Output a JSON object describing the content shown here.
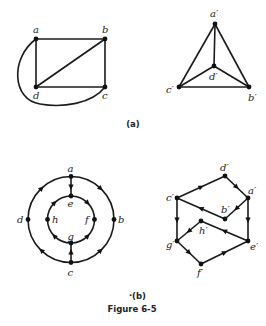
{
  "figure": {
    "caption": "Figure 6-5",
    "part_a_label": "(a)",
    "part_b_label": "(b)",
    "dot_mark": "·"
  },
  "graph_a_left": {
    "nodes": {
      "a": "a",
      "b": "b",
      "c": "c",
      "d": "d"
    },
    "edges": [
      [
        "a",
        "b"
      ],
      [
        "b",
        "c"
      ],
      [
        "c",
        "d"
      ],
      [
        "d",
        "a"
      ],
      [
        "d",
        "b"
      ],
      [
        "a",
        "c"
      ]
    ]
  },
  "graph_a_right": {
    "nodes": {
      "a": "a′",
      "b": "b′",
      "c": "c′",
      "d": "d′"
    },
    "edges": [
      [
        "a′",
        "b′"
      ],
      [
        "b′",
        "c′"
      ],
      [
        "c′",
        "a′"
      ],
      [
        "a′",
        "d′"
      ],
      [
        "b′",
        "d′"
      ],
      [
        "c′",
        "d′"
      ]
    ]
  },
  "graph_b_left": {
    "nodes": {
      "a": "a",
      "b": "b",
      "c": "c",
      "d": "d",
      "e": "e",
      "f": "f",
      "g": "g",
      "h": "h"
    },
    "directed_edges": [
      [
        "a",
        "b"
      ],
      [
        "c",
        "b"
      ],
      [
        "d",
        "a"
      ],
      [
        "c",
        "d"
      ],
      [
        "a",
        "e"
      ],
      [
        "c",
        "g"
      ],
      [
        "e",
        "f"
      ],
      [
        "g",
        "f"
      ],
      [
        "g",
        "h"
      ],
      [
        "h",
        "e"
      ]
    ]
  },
  "graph_b_right": {
    "nodes": {
      "a": "a′",
      "b": "b′",
      "c": "c′",
      "d": "d′",
      "e": "e′",
      "f": "f′",
      "g": "g′",
      "h": "h′"
    },
    "directed_edges": [
      [
        "c′",
        "d′"
      ],
      [
        "d′",
        "a′"
      ],
      [
        "a′",
        "b′"
      ],
      [
        "b′",
        "c′"
      ],
      [
        "c′",
        "g′"
      ],
      [
        "a′",
        "e′"
      ],
      [
        "e′",
        "h′"
      ],
      [
        "h′",
        "g′"
      ],
      [
        "g′",
        "f′"
      ],
      [
        "f′",
        "e′"
      ]
    ]
  }
}
